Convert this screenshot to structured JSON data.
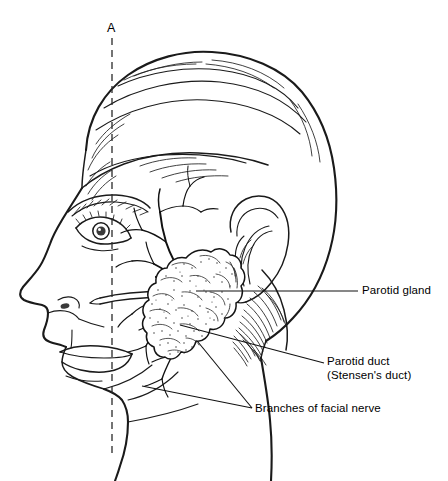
{
  "figure": {
    "background_color": "#ffffff",
    "ink_color": "#1a1a1a",
    "width": 448,
    "height": 481
  },
  "axis": {
    "label": "A",
    "style": "vertical dashed reference line",
    "color": "#2a2a2a"
  },
  "labels": {
    "parotid_gland": "Parotid gland",
    "parotid_duct_line1": "Parotid duct",
    "parotid_duct_line2": "(Stensen's duct)",
    "branches_of_facial_nerve": "Branches of facial nerve"
  },
  "structures": [
    {
      "name": "parotid-gland",
      "label": "Parotid gland",
      "description": "lobulated stippled mass anterior and inferior to the ear"
    },
    {
      "name": "parotid-duct",
      "label": "Parotid duct (Stensen's duct)",
      "description": "tubular duct running forward across the cheek"
    },
    {
      "name": "facial-nerve-branches",
      "label": "Branches of facial nerve",
      "description": "branching nerve fibers fanning out from the gland across the face"
    },
    {
      "name": "ear",
      "label": "Ear",
      "description": "auricle with helix, antihelix, tragus and lobe"
    },
    {
      "name": "head-profile",
      "label": "Head profile",
      "description": "left lateral profile of a human head with hair"
    }
  ]
}
